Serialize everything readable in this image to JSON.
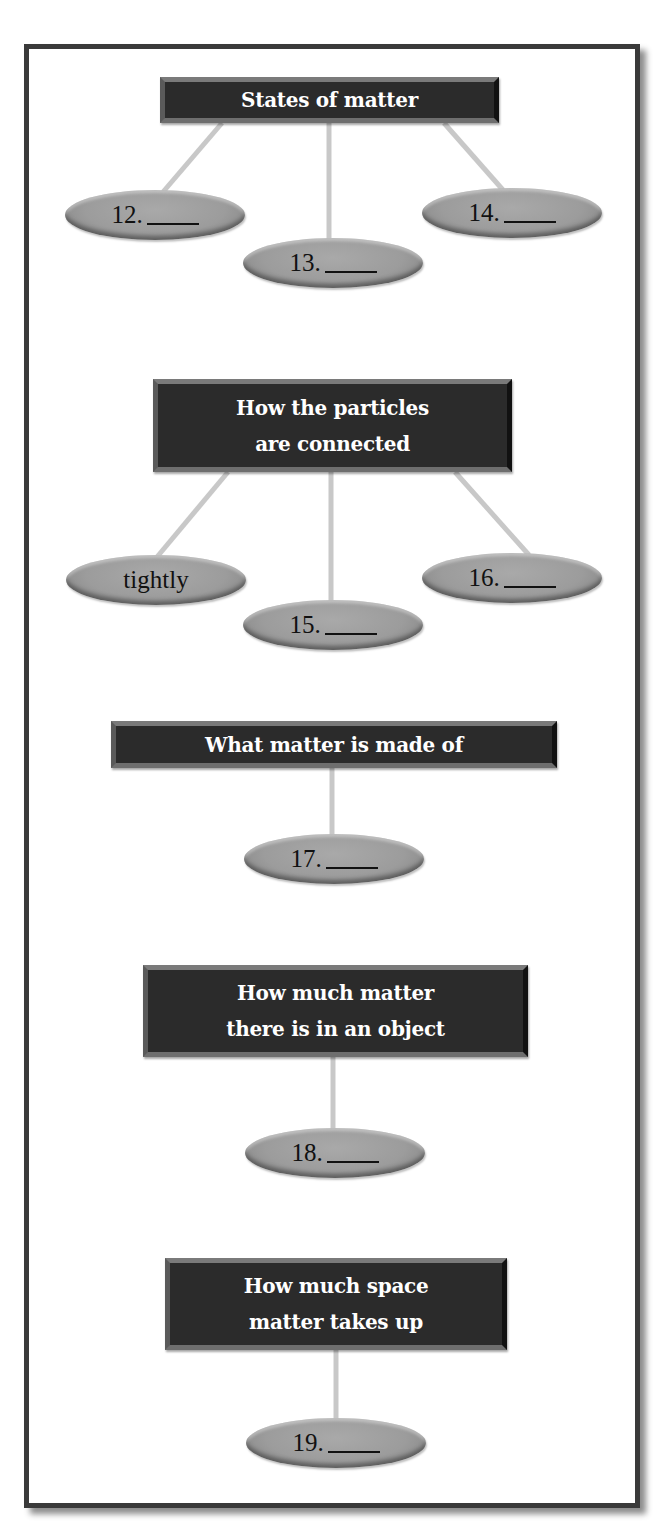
{
  "sections": [
    {
      "topic": "States of matter",
      "answers": [
        {
          "number": "12.",
          "text": ""
        },
        {
          "number": "13.",
          "text": ""
        },
        {
          "number": "14.",
          "text": ""
        }
      ]
    },
    {
      "topic": "How the particles\nare connected",
      "answers": [
        {
          "number": "",
          "text": "tightly"
        },
        {
          "number": "15.",
          "text": ""
        },
        {
          "number": "16.",
          "text": ""
        }
      ]
    },
    {
      "topic": "What matter is made of",
      "answers": [
        {
          "number": "17.",
          "text": ""
        }
      ]
    },
    {
      "topic": "How much matter\nthere is in an object",
      "answers": [
        {
          "number": "18.",
          "text": ""
        }
      ]
    },
    {
      "topic": "How much space\nmatter takes up",
      "answers": [
        {
          "number": "19.",
          "text": ""
        }
      ]
    }
  ],
  "colors": {
    "topic_bg": "#2b2b2b",
    "topic_text": "#ffffff",
    "pill_fill": "#9c9c9c",
    "connector": "#c8c8c8",
    "frame_border": "#3a3a3a"
  }
}
